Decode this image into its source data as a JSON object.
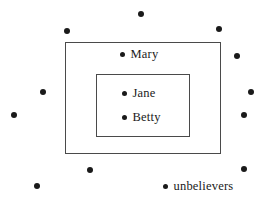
{
  "diagram": {
    "type": "euler-set-diagram",
    "background_color": "#ffffff",
    "line_color": "#4a4a4a",
    "dot_color": "#1a1a1a",
    "sets": [
      {
        "name": "outer-set",
        "shape": "rectangle",
        "x": 65,
        "y": 42,
        "width": 156,
        "height": 112,
        "label": ""
      },
      {
        "name": "inner-set",
        "shape": "rectangle",
        "x": 96,
        "y": 74,
        "width": 94,
        "height": 63,
        "label": ""
      }
    ],
    "members": [
      {
        "label": "Mary",
        "dot_x": 122,
        "dot_y": 54,
        "region": "outer-set"
      },
      {
        "label": "Jane",
        "dot_x": 124,
        "dot_y": 93,
        "region": "inner-set"
      },
      {
        "label": "Betty",
        "dot_x": 124,
        "dot_y": 117,
        "region": "inner-set"
      },
      {
        "label": "unbelievers",
        "dot_x": 165,
        "dot_y": 186,
        "region": "outside"
      }
    ],
    "unlabeled_dots": [
      {
        "x": 141,
        "y": 14,
        "size": 6
      },
      {
        "x": 67,
        "y": 31,
        "size": 6
      },
      {
        "x": 219,
        "y": 29,
        "size": 6
      },
      {
        "x": 237,
        "y": 56,
        "size": 6
      },
      {
        "x": 43,
        "y": 92,
        "size": 6
      },
      {
        "x": 251,
        "y": 92,
        "size": 6
      },
      {
        "x": 14,
        "y": 115,
        "size": 6
      },
      {
        "x": 244,
        "y": 115,
        "size": 6
      },
      {
        "x": 244,
        "y": 169,
        "size": 6
      },
      {
        "x": 90,
        "y": 170,
        "size": 6
      },
      {
        "x": 37,
        "y": 186,
        "size": 6
      }
    ]
  }
}
